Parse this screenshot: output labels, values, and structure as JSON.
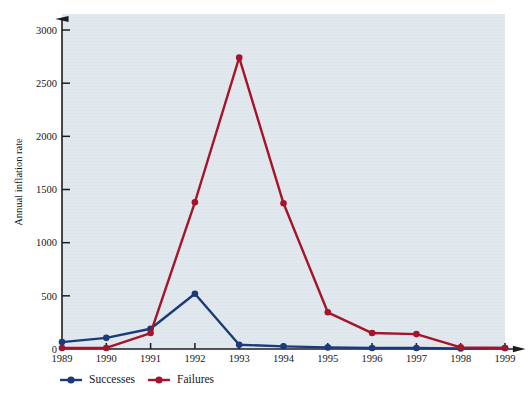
{
  "chart_data": {
    "type": "line",
    "title": "",
    "xlabel": "",
    "ylabel": "Annual inflation rate",
    "categories": [
      "1989",
      "1990",
      "1991",
      "1992",
      "1993",
      "1994",
      "1995",
      "1996",
      "1997",
      "1998",
      "1999"
    ],
    "x": [
      1989,
      1990,
      1991,
      1992,
      1993,
      1994,
      1995,
      1996,
      1997,
      1998,
      1999
    ],
    "xlim": [
      1989,
      1999
    ],
    "ylim": [
      0,
      3100
    ],
    "yticks": [
      0,
      500,
      1000,
      1500,
      2000,
      2500,
      3000
    ],
    "ytick_labels": [
      "0",
      "500",
      "1000",
      "1500",
      "2000",
      "2500",
      "3000"
    ],
    "grid": false,
    "legend_position": "bottom-left",
    "series": [
      {
        "name": "Successes",
        "color": "#1b3a7a",
        "marker": "circle",
        "values": [
          65,
          105,
          190,
          520,
          40,
          25,
          15,
          10,
          10,
          5,
          10
        ]
      },
      {
        "name": "Failures",
        "color": "#a5142a",
        "marker": "circle",
        "values": [
          10,
          10,
          150,
          1380,
          2740,
          1370,
          345,
          150,
          140,
          15,
          10
        ]
      }
    ]
  },
  "legend": {
    "items": [
      {
        "label": "Successes",
        "color": "#1b3a7a"
      },
      {
        "label": "Failures",
        "color": "#a5142a"
      }
    ]
  },
  "colors": {
    "plot_background": "#dde5ec",
    "page_background": "#ffffff",
    "axis": "#1c1c20",
    "successes": "#1b3a7a",
    "failures": "#a5142a"
  }
}
